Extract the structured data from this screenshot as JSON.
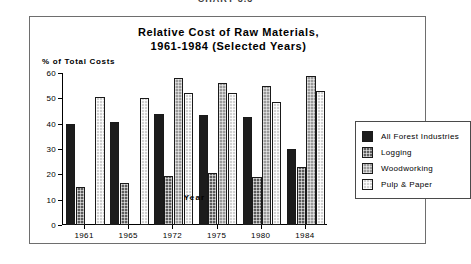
{
  "caption": "CHART 3.3",
  "chart_data": {
    "type": "bar",
    "title": "Relative Cost of Raw Materials, 1961-1984 (Selected Years)",
    "title_lines": [
      "Relative Cost of Raw Materials,",
      "1961-1984 (Selected Years)"
    ],
    "xlabel": "Year",
    "ylabel": "% of Total Costs",
    "ylim": [
      0,
      60
    ],
    "yticks": [
      0,
      10,
      20,
      30,
      40,
      50,
      60
    ],
    "ytick_labels": [
      "0",
      "10",
      "20",
      "30",
      "40",
      "50",
      "60"
    ],
    "grid": false,
    "legend_position": "right",
    "categories": [
      "1961",
      "1965",
      "1972",
      "1975",
      "1980",
      "1984"
    ],
    "series": [
      {
        "name": "All Forest Industries",
        "color": "#1c1c1c",
        "pattern": "solid-black",
        "values": [
          40,
          40.5,
          44,
          43.5,
          42.5,
          30
        ]
      },
      {
        "name": "Logging",
        "color": "#5d5d5d",
        "pattern": "dark-crosshatch",
        "values": [
          15,
          16.5,
          19.5,
          20.5,
          19,
          23
        ]
      },
      {
        "name": "Woodworking",
        "color": "#9a9a9a",
        "pattern": "medium-crosshatch",
        "values": [
          null,
          null,
          58,
          56,
          55,
          59
        ]
      },
      {
        "name": "Pulp & Paper",
        "color": "#d2d2d2",
        "pattern": "light-crosshatch",
        "values": [
          50.5,
          50,
          52,
          52,
          48.5,
          53
        ]
      }
    ]
  }
}
